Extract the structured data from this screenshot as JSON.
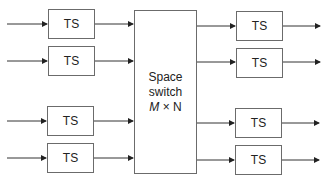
{
  "diagram": {
    "left_blocks": [
      {
        "label": "TS"
      },
      {
        "label": "TS"
      },
      {
        "label": "TS"
      },
      {
        "label": "TS"
      }
    ],
    "space_switch": {
      "line1": "Space",
      "line2": "switch",
      "dim_m": "M",
      "dim_x": " × ",
      "dim_n": "N"
    },
    "right_blocks": [
      {
        "label": "TS"
      },
      {
        "label": "TS"
      },
      {
        "label": "TS"
      },
      {
        "label": "TS"
      }
    ],
    "colors": {
      "line": "#333333",
      "border": "#6b6b6b"
    }
  }
}
